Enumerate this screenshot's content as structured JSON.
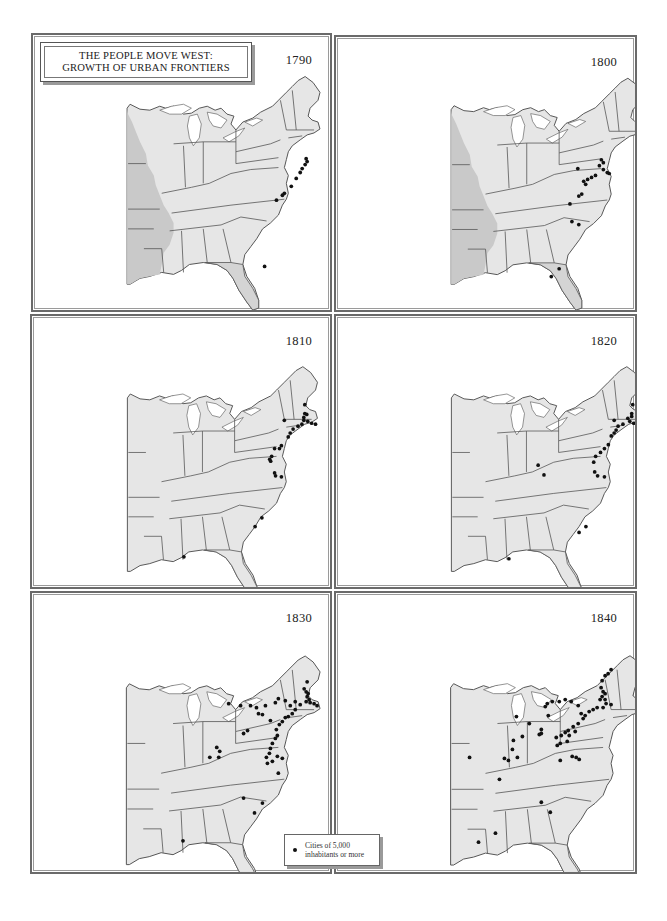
{
  "title": {
    "line1": "THE PEOPLE MOVE WEST:",
    "line2": "GROWTH OF URBAN FRONTIERS"
  },
  "legend": {
    "symbol": "dot",
    "line1": "Cities of 5,000",
    "line2": "inhabitants or more"
  },
  "colors": {
    "land": "#e6e6e6",
    "territory": "#c9c9c9",
    "florida_spanish": "#d4d4d4",
    "border": "#555555",
    "dot": "#111111"
  },
  "panels": [
    {
      "year": "1790",
      "territory_west": true,
      "florida_shaded": true,
      "cities": [
        [
          276,
          125
        ],
        [
          277,
          128
        ],
        [
          275,
          131
        ],
        [
          272,
          135
        ],
        [
          270,
          139
        ],
        [
          266,
          145
        ],
        [
          261,
          153
        ],
        [
          254,
          160
        ],
        [
          252,
          162
        ],
        [
          246,
          167
        ],
        [
          234,
          234
        ]
      ]
    },
    {
      "year": "1800",
      "territory_west": true,
      "florida_shaded": true,
      "cities": [
        [
          248,
          125
        ],
        [
          250,
          128
        ],
        [
          246,
          131
        ],
        [
          250,
          135
        ],
        [
          254,
          138
        ],
        [
          256,
          139
        ],
        [
          242,
          141
        ],
        [
          238,
          143
        ],
        [
          234,
          145
        ],
        [
          230,
          147
        ],
        [
          224,
          134
        ],
        [
          232,
          150
        ],
        [
          228,
          160
        ],
        [
          225,
          162
        ],
        [
          216,
          170
        ],
        [
          218,
          188
        ],
        [
          225,
          191
        ],
        [
          205,
          236
        ],
        [
          197,
          244
        ]
      ]
    },
    {
      "year": "1810",
      "territory_west": false,
      "florida_shaded": false,
      "cities": [
        [
          277,
          81
        ],
        [
          277,
          90
        ],
        [
          279,
          91
        ],
        [
          276,
          94
        ],
        [
          276,
          97
        ],
        [
          280,
          98
        ],
        [
          284,
          100
        ],
        [
          288,
          101
        ],
        [
          256,
          97
        ],
        [
          274,
          101
        ],
        [
          270,
          103
        ],
        [
          265,
          106
        ],
        [
          262,
          110
        ],
        [
          260,
          114
        ],
        [
          253,
          123
        ],
        [
          251,
          126
        ],
        [
          246,
          126
        ],
        [
          243,
          134
        ],
        [
          241,
          137
        ],
        [
          242,
          139
        ],
        [
          246,
          151
        ],
        [
          247,
          154
        ],
        [
          253,
          155
        ],
        [
          233,
          197
        ],
        [
          226,
          206
        ],
        [
          153,
          237
        ]
      ]
    },
    {
      "year": "1820",
      "territory_west": false,
      "florida_shaded": false,
      "cities": [
        [
          281,
          81
        ],
        [
          280,
          90
        ],
        [
          280,
          93
        ],
        [
          276,
          95
        ],
        [
          278,
          98
        ],
        [
          282,
          100
        ],
        [
          287,
          100
        ],
        [
          262,
          97
        ],
        [
          271,
          101
        ],
        [
          266,
          103
        ],
        [
          264,
          107
        ],
        [
          262,
          110
        ],
        [
          259,
          113
        ],
        [
          256,
          122
        ],
        [
          252,
          126
        ],
        [
          248,
          130
        ],
        [
          243,
          134
        ],
        [
          241,
          140
        ],
        [
          242,
          150
        ],
        [
          245,
          154
        ],
        [
          252,
          155
        ],
        [
          184,
          143
        ],
        [
          190,
          153
        ],
        [
          233,
          206
        ],
        [
          226,
          212
        ],
        [
          154,
          239
        ]
      ]
    },
    {
      "year": "1830",
      "territory_west": false,
      "florida_shaded": false,
      "cities": [
        [
          277,
          68
        ],
        [
          274,
          75
        ],
        [
          276,
          78
        ],
        [
          278,
          80
        ],
        [
          277,
          83
        ],
        [
          279,
          86
        ],
        [
          276,
          88
        ],
        [
          280,
          89
        ],
        [
          284,
          90
        ],
        [
          287,
          92
        ],
        [
          270,
          91
        ],
        [
          265,
          96
        ],
        [
          262,
          100
        ],
        [
          258,
          103
        ],
        [
          255,
          104
        ],
        [
          252,
          108
        ],
        [
          249,
          111
        ],
        [
          246,
          116
        ],
        [
          240,
          107
        ],
        [
          232,
          101
        ],
        [
          228,
          100
        ],
        [
          226,
          94
        ],
        [
          235,
          92
        ],
        [
          245,
          89
        ],
        [
          248,
          85
        ],
        [
          255,
          87
        ],
        [
          260,
          92
        ],
        [
          265,
          88
        ],
        [
          220,
          92
        ],
        [
          210,
          92
        ],
        [
          198,
          90
        ],
        [
          247,
          122
        ],
        [
          245,
          125
        ],
        [
          242,
          130
        ],
        [
          240,
          135
        ],
        [
          239,
          140
        ],
        [
          236,
          144
        ],
        [
          242,
          148
        ],
        [
          237,
          150
        ],
        [
          217,
          117
        ],
        [
          213,
          120
        ],
        [
          186,
          134
        ],
        [
          189,
          138
        ],
        [
          179,
          144
        ],
        [
          188,
          144
        ],
        [
          247,
          143
        ],
        [
          252,
          145
        ],
        [
          248,
          160
        ],
        [
          213,
          185
        ],
        [
          224,
          200
        ],
        [
          232,
          190
        ],
        [
          152,
          228
        ]
      ]
    },
    {
      "year": "1840",
      "territory_west": false,
      "florida_shaded": false,
      "cities": [
        [
          256,
          56
        ],
        [
          253,
          60
        ],
        [
          250,
          62
        ],
        [
          247,
          67
        ],
        [
          246,
          74
        ],
        [
          248,
          78
        ],
        [
          250,
          80
        ],
        [
          247,
          83
        ],
        [
          245,
          86
        ],
        [
          250,
          86
        ],
        [
          251,
          90
        ],
        [
          256,
          91
        ],
        [
          248,
          94
        ],
        [
          242,
          94
        ],
        [
          238,
          96
        ],
        [
          234,
          98
        ],
        [
          230,
          102
        ],
        [
          228,
          105
        ],
        [
          226,
          100
        ],
        [
          223,
          92
        ],
        [
          216,
          88
        ],
        [
          210,
          86
        ],
        [
          204,
          88
        ],
        [
          197,
          88
        ],
        [
          192,
          90
        ],
        [
          190,
          93
        ],
        [
          193,
          102
        ],
        [
          174,
          110
        ],
        [
          161,
          103
        ],
        [
          223,
          110
        ],
        [
          218,
          113
        ],
        [
          213,
          117
        ],
        [
          210,
          119
        ],
        [
          206,
          122
        ],
        [
          201,
          124
        ],
        [
          220,
          118
        ],
        [
          214,
          122
        ],
        [
          212,
          128
        ],
        [
          205,
          130
        ],
        [
          202,
          132
        ],
        [
          186,
          116
        ],
        [
          186,
          120
        ],
        [
          184,
          121
        ],
        [
          167,
          123
        ],
        [
          158,
          127
        ],
        [
          157,
          136
        ],
        [
          149,
          145
        ],
        [
          153,
          147
        ],
        [
          162,
          144
        ],
        [
          217,
          143
        ],
        [
          221,
          144
        ],
        [
          224,
          146
        ],
        [
          205,
          147
        ],
        [
          114,
          144
        ],
        [
          144,
          166
        ],
        [
          186,
          189
        ],
        [
          195,
          199
        ],
        [
          140,
          220
        ],
        [
          123,
          229
        ]
      ]
    }
  ]
}
